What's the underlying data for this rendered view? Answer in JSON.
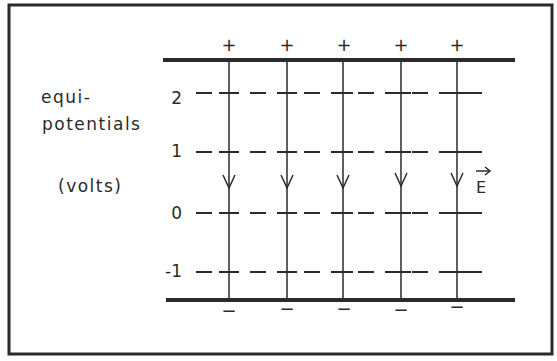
{
  "figure": {
    "axis_label_line1": "equi-",
    "axis_label_line2": "potentials",
    "axis_units": "(volts)",
    "field_label": "E",
    "field_label_vector_mark": "→",
    "equipotentials": [
      {
        "label": "2",
        "value": 2
      },
      {
        "label": "1",
        "value": 1
      },
      {
        "label": "0",
        "value": 0
      },
      {
        "label": "-1",
        "value": -1
      }
    ],
    "top_plate_charges": [
      "+",
      "+",
      "+",
      "+",
      "+"
    ],
    "bottom_plate_charges": [
      "−",
      "−",
      "−",
      "−",
      "−"
    ],
    "field_line_count": 5,
    "colors": {
      "ink": "#2a2a2a",
      "background": "#ffffff"
    }
  }
}
